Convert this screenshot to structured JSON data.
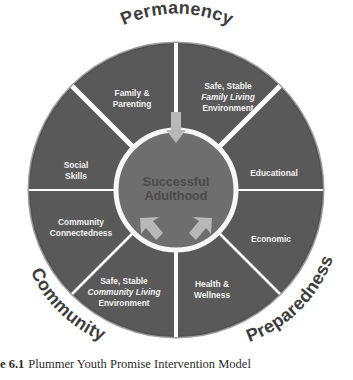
{
  "figure": {
    "caption_number": "e 6.1",
    "caption_text": "Plummer Youth Promise Intervention Model"
  },
  "hub": {
    "line1": "Successful",
    "line2": "Adulthood"
  },
  "colors": {
    "wheel": "#595959",
    "wheel_dark": "#4f4f4f",
    "spoke": "#ffffff",
    "hub_fill": "#6e6e6e",
    "hub_ring": "#f7f7f7",
    "hub_text": "#4a4a4a",
    "segment_text": "#f2f2f2",
    "domain_text": "#3d3d3d",
    "arrow": "#b5b5b5",
    "background": "#ffffff"
  },
  "domains": [
    {
      "name": "permanency",
      "label": "Permanency",
      "position": "top"
    },
    {
      "name": "preparedness",
      "label": "Preparedness",
      "position": "bottom-right"
    },
    {
      "name": "community",
      "label": "Community",
      "position": "bottom-left"
    }
  ],
  "segments": [
    {
      "name": "family-parenting",
      "lines": [
        {
          "text": "Family &",
          "italic": false
        },
        {
          "text": "Parenting",
          "italic": false
        }
      ]
    },
    {
      "name": "safe-stable-family-living-environment",
      "lines": [
        {
          "text": "Safe, Stable",
          "italic": false
        },
        {
          "text": "Family Living",
          "italic": true
        },
        {
          "text": "Environment",
          "italic": false
        }
      ]
    },
    {
      "name": "educational",
      "lines": [
        {
          "text": "Educational",
          "italic": false
        }
      ]
    },
    {
      "name": "economic",
      "lines": [
        {
          "text": "Economic",
          "italic": false
        }
      ]
    },
    {
      "name": "health-wellness",
      "lines": [
        {
          "text": "Health &",
          "italic": false
        },
        {
          "text": "Wellness",
          "italic": false
        }
      ]
    },
    {
      "name": "safe-stable-community-living-environment",
      "lines": [
        {
          "text": "Safe, Stable",
          "italic": false
        },
        {
          "text": "Community Living",
          "italic": true
        },
        {
          "text": "Environment",
          "italic": false
        }
      ]
    },
    {
      "name": "community-connectedness",
      "lines": [
        {
          "text": "Community",
          "italic": false
        },
        {
          "text": "Connectedness",
          "italic": false
        }
      ]
    },
    {
      "name": "social-skills",
      "lines": [
        {
          "text": "Social",
          "italic": false
        },
        {
          "text": "Skills",
          "italic": false
        }
      ]
    }
  ],
  "arrows": [
    {
      "name": "arrow-permanency-to-hub",
      "direction": "down"
    },
    {
      "name": "arrow-community-to-hub",
      "direction": "up-right"
    },
    {
      "name": "arrow-preparedness-to-hub",
      "direction": "up-left"
    }
  ]
}
